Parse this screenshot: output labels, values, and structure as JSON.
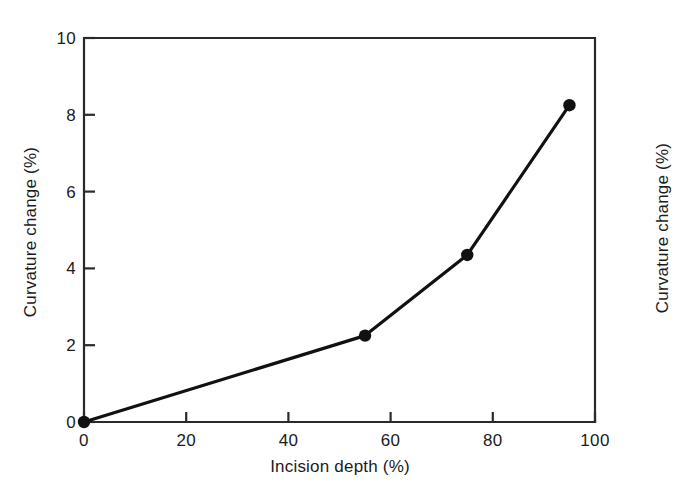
{
  "figure": {
    "background_color": "#ffffff",
    "ink_color": "#1b1b1b"
  },
  "chart_data": {
    "type": "line",
    "title": "",
    "subtitle": "",
    "xlabel": "Incision depth (%)",
    "ylabel": "Curvature change (%)",
    "xlim": [
      0,
      100
    ],
    "ylim": [
      0,
      10
    ],
    "xticks": [
      0,
      20,
      40,
      60,
      80,
      100
    ],
    "yticks": [
      0,
      2,
      4,
      6,
      8,
      10
    ],
    "xtick_labels": [
      "0",
      "20",
      "40",
      "60",
      "80",
      "100"
    ],
    "ytick_labels": [
      "0",
      "2",
      "4",
      "6",
      "8",
      "10"
    ],
    "grid": false,
    "legend": null,
    "legend_position": "none",
    "marker": "filled-circle",
    "marker_color": "#111111",
    "line_color": "#111111",
    "series": [
      {
        "name": "Curvature change",
        "x": [
          0,
          55,
          75,
          95
        ],
        "values": [
          0,
          2.25,
          4.35,
          8.25
        ]
      }
    ],
    "annotations": []
  },
  "secondary_label": {
    "text": "Curvature change (%)",
    "note": "partially visible axis label of adjacent figure at right edge"
  }
}
